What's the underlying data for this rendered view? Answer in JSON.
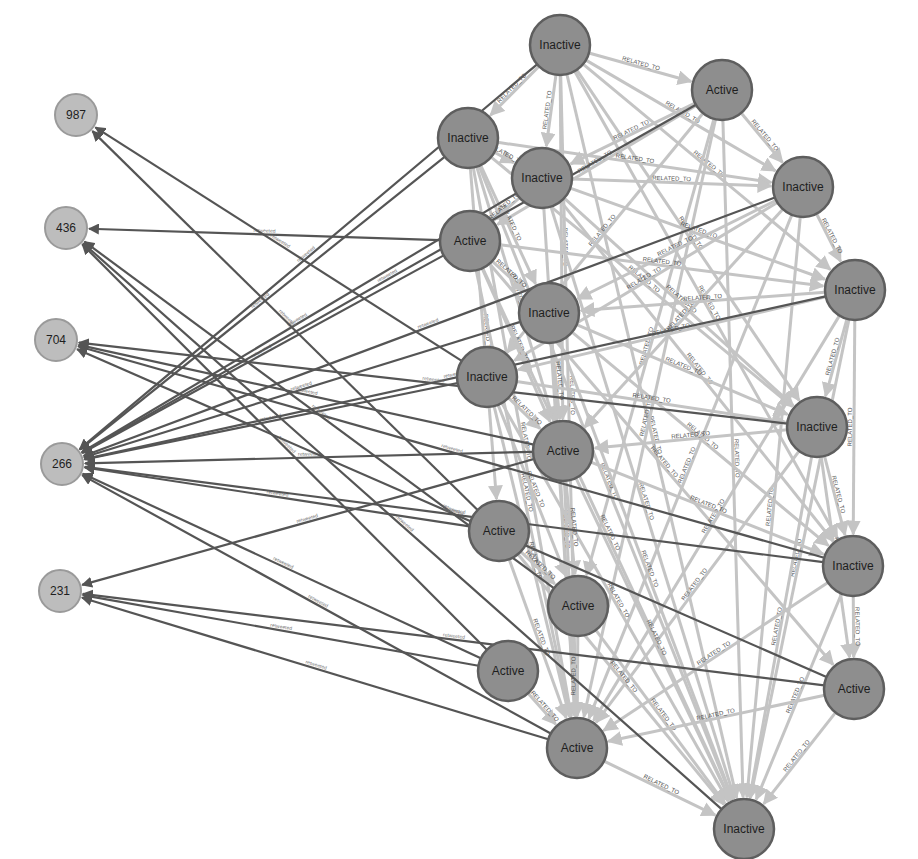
{
  "graph": {
    "colors": {
      "big_node_fill": "#8e8e8e",
      "big_node_stroke": "#5e5e5e",
      "small_node_fill": "#bdbdbd",
      "related_edge": "#c4c4c4",
      "retweeted_edge": "#555555"
    },
    "edge_types": {
      "related": "RELATED_TO",
      "retweeted": "retweeted"
    },
    "small_nodes": [
      {
        "id": "s987",
        "label": "987",
        "x": 76,
        "y": 115
      },
      {
        "id": "s436",
        "label": "436",
        "x": 66,
        "y": 228
      },
      {
        "id": "s704",
        "label": "704",
        "x": 56,
        "y": 340
      },
      {
        "id": "s266",
        "label": "266",
        "x": 62,
        "y": 464
      },
      {
        "id": "s231",
        "label": "231",
        "x": 60,
        "y": 591
      }
    ],
    "big_nodes": [
      {
        "id": "n1",
        "label": "Inactive",
        "x": 560,
        "y": 45
      },
      {
        "id": "n2",
        "label": "Active",
        "x": 722,
        "y": 90
      },
      {
        "id": "n3",
        "label": "Inactive",
        "x": 468,
        "y": 138
      },
      {
        "id": "n4",
        "label": "Inactive",
        "x": 542,
        "y": 178
      },
      {
        "id": "n5",
        "label": "Inactive",
        "x": 803,
        "y": 187
      },
      {
        "id": "n6",
        "label": "Active",
        "x": 470,
        "y": 241
      },
      {
        "id": "n7",
        "label": "Inactive",
        "x": 855,
        "y": 290
      },
      {
        "id": "n8",
        "label": "Inactive",
        "x": 549,
        "y": 313
      },
      {
        "id": "n9",
        "label": "Inactive",
        "x": 487,
        "y": 377
      },
      {
        "id": "n10",
        "label": "Inactive",
        "x": 817,
        "y": 427
      },
      {
        "id": "n11",
        "label": "Active",
        "x": 563,
        "y": 451
      },
      {
        "id": "n12",
        "label": "Active",
        "x": 499,
        "y": 531
      },
      {
        "id": "n13",
        "label": "Inactive",
        "x": 853,
        "y": 566
      },
      {
        "id": "n14",
        "label": "Active",
        "x": 578,
        "y": 606
      },
      {
        "id": "n15",
        "label": "Active",
        "x": 508,
        "y": 671
      },
      {
        "id": "n16",
        "label": "Active",
        "x": 854,
        "y": 689
      },
      {
        "id": "n17",
        "label": "Active",
        "x": 577,
        "y": 748
      },
      {
        "id": "n18",
        "label": "Inactive",
        "x": 744,
        "y": 829
      }
    ],
    "retweeted_edges": [
      [
        "n3",
        "s266"
      ],
      [
        "n6",
        "s266"
      ],
      [
        "n6",
        "s436"
      ],
      [
        "n4",
        "s266"
      ],
      [
        "n8",
        "s266"
      ],
      [
        "n9",
        "s266"
      ],
      [
        "n5",
        "s266"
      ],
      [
        "n7",
        "s266"
      ],
      [
        "n11",
        "s266"
      ],
      [
        "n12",
        "s266"
      ],
      [
        "n2",
        "s266"
      ],
      [
        "n1",
        "s266"
      ],
      [
        "n9",
        "s987"
      ],
      [
        "n12",
        "s987"
      ],
      [
        "n14",
        "s436"
      ],
      [
        "n15",
        "s436"
      ],
      [
        "n11",
        "s704"
      ],
      [
        "n13",
        "s704"
      ],
      [
        "n10",
        "s704"
      ],
      [
        "n16",
        "s704"
      ],
      [
        "n15",
        "s266"
      ],
      [
        "n17",
        "s266"
      ],
      [
        "n11",
        "s231"
      ],
      [
        "n15",
        "s231"
      ],
      [
        "n16",
        "s231"
      ],
      [
        "n17",
        "s231"
      ],
      [
        "n18",
        "s436"
      ],
      [
        "n13",
        "s266"
      ]
    ],
    "related_edges": [
      [
        "n1",
        "n2"
      ],
      [
        "n1",
        "n3"
      ],
      [
        "n1",
        "n4"
      ],
      [
        "n1",
        "n5"
      ],
      [
        "n1",
        "n7"
      ],
      [
        "n1",
        "n10"
      ],
      [
        "n1",
        "n11"
      ],
      [
        "n1",
        "n13"
      ],
      [
        "n1",
        "n17"
      ],
      [
        "n1",
        "n18"
      ],
      [
        "n2",
        "n5"
      ],
      [
        "n2",
        "n4"
      ],
      [
        "n2",
        "n6"
      ],
      [
        "n2",
        "n9"
      ],
      [
        "n2",
        "n17"
      ],
      [
        "n2",
        "n18"
      ],
      [
        "n2",
        "n14"
      ],
      [
        "n3",
        "n4"
      ],
      [
        "n3",
        "n5"
      ],
      [
        "n3",
        "n8"
      ],
      [
        "n3",
        "n11"
      ],
      [
        "n3",
        "n17"
      ],
      [
        "n3",
        "n18"
      ],
      [
        "n3",
        "n12"
      ],
      [
        "n3",
        "n10"
      ],
      [
        "n4",
        "n5"
      ],
      [
        "n4",
        "n6"
      ],
      [
        "n4",
        "n7"
      ],
      [
        "n4",
        "n10"
      ],
      [
        "n4",
        "n13"
      ],
      [
        "n4",
        "n18"
      ],
      [
        "n4",
        "n17"
      ],
      [
        "n5",
        "n7"
      ],
      [
        "n5",
        "n9"
      ],
      [
        "n5",
        "n17"
      ],
      [
        "n5",
        "n18"
      ],
      [
        "n5",
        "n8"
      ],
      [
        "n5",
        "n11"
      ],
      [
        "n6",
        "n8"
      ],
      [
        "n6",
        "n7"
      ],
      [
        "n6",
        "n11"
      ],
      [
        "n6",
        "n17"
      ],
      [
        "n6",
        "n18"
      ],
      [
        "n6",
        "n16"
      ],
      [
        "n7",
        "n10"
      ],
      [
        "n7",
        "n13"
      ],
      [
        "n7",
        "n9"
      ],
      [
        "n7",
        "n17"
      ],
      [
        "n7",
        "n18"
      ],
      [
        "n7",
        "n8"
      ],
      [
        "n8",
        "n10"
      ],
      [
        "n8",
        "n11"
      ],
      [
        "n8",
        "n17"
      ],
      [
        "n8",
        "n18"
      ],
      [
        "n8",
        "n13"
      ],
      [
        "n9",
        "n11"
      ],
      [
        "n9",
        "n10"
      ],
      [
        "n9",
        "n17"
      ],
      [
        "n9",
        "n18"
      ],
      [
        "n9",
        "n14"
      ],
      [
        "n10",
        "n13"
      ],
      [
        "n10",
        "n16"
      ],
      [
        "n10",
        "n17"
      ],
      [
        "n10",
        "n18"
      ],
      [
        "n10",
        "n11"
      ],
      [
        "n11",
        "n13"
      ],
      [
        "n11",
        "n17"
      ],
      [
        "n11",
        "n18"
      ],
      [
        "n11",
        "n14"
      ],
      [
        "n12",
        "n17"
      ],
      [
        "n12",
        "n14"
      ],
      [
        "n12",
        "n18"
      ],
      [
        "n13",
        "n16"
      ],
      [
        "n13",
        "n17"
      ],
      [
        "n13",
        "n18"
      ],
      [
        "n14",
        "n17"
      ],
      [
        "n14",
        "n18"
      ],
      [
        "n15",
        "n17"
      ],
      [
        "n16",
        "n17"
      ],
      [
        "n16",
        "n18"
      ],
      [
        "n17",
        "n18"
      ]
    ]
  }
}
